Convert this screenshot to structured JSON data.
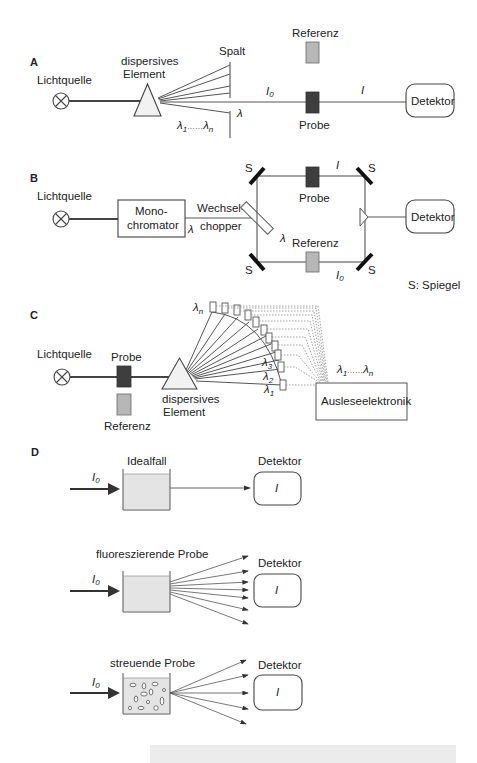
{
  "sections": {
    "A": {
      "label": "A",
      "light_source": "Lichtquelle",
      "dispersive_line1": "dispersives",
      "dispersive_line2": "Element",
      "slit": "Spalt",
      "reference": "Referenz",
      "sample": "Probe",
      "detector": "Detektor",
      "I0": "I",
      "I0_sub": "0",
      "I": "I",
      "lambda": "λ",
      "lambda_range_start": "λ",
      "lambda_range_start_sub": "1",
      "lambda_range_dots": "……",
      "lambda_range_end": "λ",
      "lambda_range_end_sub": "n"
    },
    "B": {
      "label": "B",
      "light_source": "Lichtquelle",
      "monochromator_line1": "Mono-",
      "monochromator_line2": "chromator",
      "chopper_line1": "Wechsel-",
      "chopper_line2": "chopper",
      "lambda_out": "λ",
      "lambda_inner": "λ",
      "mirror": "S",
      "sample": "Probe",
      "reference": "Referenz",
      "I": "I",
      "I0": "I",
      "I0_sub": "0",
      "detector": "Detektor",
      "legend": "S: Spiegel"
    },
    "C": {
      "label": "C",
      "light_source": "Lichtquelle",
      "sample": "Probe",
      "reference": "Referenz",
      "dispersive_line1": "dispersives",
      "dispersive_line2": "Element",
      "lambda_n": "λ",
      "lambda_n_sub": "n",
      "lambda_3": "λ",
      "lambda_3_sub": "3",
      "lambda_2": "λ",
      "lambda_2_sub": "2",
      "lambda_1": "λ",
      "lambda_1_sub": "1",
      "range_start": "λ",
      "range_start_sub": "1",
      "range_dots": "……",
      "range_end": "λ",
      "range_end_sub": "n",
      "readout": "Ausleseelektronik"
    },
    "D": {
      "label": "D",
      "cases": [
        {
          "title": "Idealfall",
          "incident": "I",
          "incident_sub": "0",
          "detector": "Detektor",
          "detector_value": "I"
        },
        {
          "title": "fluoreszierende Probe",
          "incident": "I",
          "incident_sub": "0",
          "detector": "Detektor",
          "detector_value": "I"
        },
        {
          "title": "streuende Probe",
          "incident": "I",
          "incident_sub": "0",
          "detector": "Detektor",
          "detector_value": "I"
        }
      ]
    }
  },
  "colors": {
    "sample_dark": "#3e3e3e",
    "reference_gray": "#b7b7b7",
    "cuvette_fill": "#e4e4e4",
    "caption_strip": "#ececec"
  }
}
